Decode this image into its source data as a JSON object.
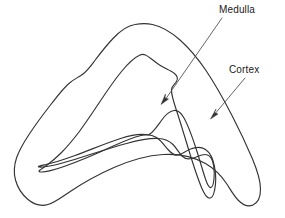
{
  "figure": {
    "background_color": "#ffffff",
    "line_color": "#333333",
    "leader_color": "#555555",
    "width": 285,
    "height": 218
  },
  "labels": [
    {
      "id": "medulla",
      "text": "Medulla",
      "x": 219,
      "y": 4,
      "leader": {
        "from_x": 222,
        "from_y": 18,
        "to_x": 162,
        "to_y": 103
      }
    },
    {
      "id": "cortex",
      "text": "Cortex",
      "x": 229,
      "y": 64,
      "leader": {
        "from_x": 245,
        "from_y": 78,
        "to_x": 211,
        "to_y": 118
      }
    }
  ],
  "contours": {
    "outer": "Outer boundary of the sectioned structure",
    "middle": "Middle boundary separating outer rind from interior",
    "inner": "Innermost boundary of the central region"
  }
}
